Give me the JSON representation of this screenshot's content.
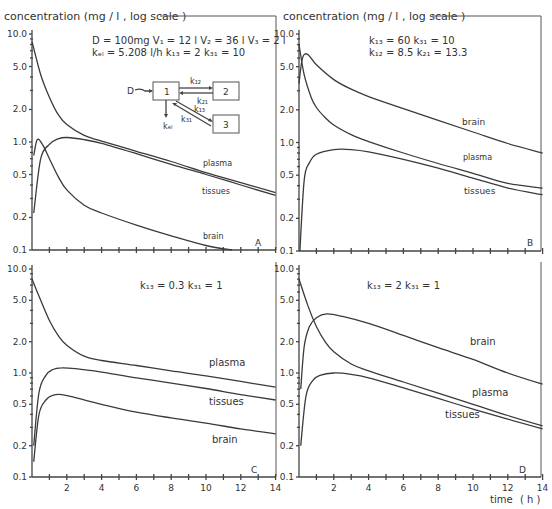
{
  "figure": {
    "ylabel_left": "concentration (mg / l , log scale )",
    "ylabel_right": "concentration (mg / l , log scale )",
    "xlabel": "time",
    "xunit": "( h )",
    "y_tick_labels": [
      "10.0",
      "5.0",
      "2.0",
      "1.0",
      "0.5",
      "0.2",
      "0.1"
    ],
    "x_tick_labels": [
      "2",
      "4",
      "6",
      "8",
      "10",
      "12",
      "14"
    ]
  },
  "panel_a": {
    "letter": "A",
    "params_line1": "D = 100mg  V₁ = 12 l  V₂ = 36 l  V₃ = 2 l",
    "params_line2": "kₑₗ = 5.208 l/h  k₁₃ = 2  k₃₁ = 10",
    "diagram": {
      "dose": "D",
      "box1": "1",
      "box2": "2",
      "box3": "3",
      "k12": "k₁₂",
      "k21": "k₂₁",
      "k13": "k₁₃",
      "k31": "k₃₁",
      "kel": "kₑₗ"
    },
    "labels": {
      "plasma": "plasma",
      "tissues": "tissues",
      "brain": "brain"
    }
  },
  "panel_b": {
    "letter": "B",
    "params_line1": "k₁₃ = 60  k₃₁ = 10",
    "params_line2": "k₁₂ = 8.5  k₂₁ = 13.3",
    "labels": {
      "plasma": "plasma",
      "tissues": "tissues",
      "brain": "brain"
    }
  },
  "panel_c": {
    "letter": "C",
    "params_line1": "k₁₃ = 0.3  k₃₁ = 1",
    "labels": {
      "plasma": "plasma",
      "tissues": "tissues",
      "brain": "brain"
    }
  },
  "panel_d": {
    "letter": "D",
    "params_line1": "k₁₃ = 2  k₃₁ = 1",
    "labels": {
      "plasma": "plasma",
      "tissues": "tissues",
      "brain": "brain"
    }
  },
  "chart_data": [
    {
      "type": "line",
      "title": "A",
      "xlabel": "time (h)",
      "ylabel": "concentration (mg/l, log scale)",
      "xlim": [
        0,
        14
      ],
      "ylim": [
        0.1,
        10
      ],
      "yscale": "log",
      "series": [
        {
          "name": "plasma",
          "x": [
            0,
            0.5,
            1,
            1.5,
            2,
            3,
            4,
            6,
            8,
            10,
            12,
            14
          ],
          "values": [
            8.5,
            4.2,
            2.6,
            1.8,
            1.45,
            1.15,
            1.02,
            0.82,
            0.66,
            0.52,
            0.42,
            0.34
          ]
        },
        {
          "name": "tissues",
          "x": [
            0.1,
            0.5,
            1,
            1.5,
            2,
            3,
            4,
            6,
            8,
            10,
            12,
            14
          ],
          "values": [
            0.22,
            0.7,
            0.95,
            1.07,
            1.1,
            1.05,
            0.97,
            0.78,
            0.62,
            0.5,
            0.4,
            0.32
          ]
        },
        {
          "name": "brain",
          "x": [
            0.1,
            0.3,
            0.6,
            1,
            1.5,
            2,
            3,
            4,
            6,
            8,
            10,
            11.5
          ],
          "values": [
            0.75,
            1.05,
            0.95,
            0.7,
            0.48,
            0.36,
            0.26,
            0.22,
            0.17,
            0.135,
            0.11,
            0.1
          ]
        }
      ]
    },
    {
      "type": "line",
      "title": "B",
      "xlabel": "time (h)",
      "ylabel": "concentration (mg/l, log scale)",
      "xlim": [
        0,
        14
      ],
      "ylim": [
        0.1,
        10
      ],
      "yscale": "log",
      "series": [
        {
          "name": "plasma",
          "x": [
            0,
            0.3,
            0.7,
            1,
            1.5,
            2,
            3,
            4,
            6,
            8,
            10,
            12,
            14
          ],
          "values": [
            8.0,
            4.2,
            2.6,
            2.1,
            1.7,
            1.45,
            1.18,
            1.02,
            0.8,
            0.64,
            0.52,
            0.42,
            0.38
          ]
        },
        {
          "name": "tissues",
          "x": [
            0.05,
            0.3,
            0.6,
            1,
            2,
            3,
            4,
            6,
            8,
            10,
            12,
            14
          ],
          "values": [
            0.1,
            0.45,
            0.65,
            0.78,
            0.86,
            0.86,
            0.82,
            0.7,
            0.58,
            0.47,
            0.38,
            0.33
          ]
        },
        {
          "name": "brain",
          "x": [
            0,
            0.2,
            0.5,
            1,
            2,
            3,
            4,
            6,
            8,
            10,
            12,
            14
          ],
          "values": [
            3.5,
            6.0,
            6.5,
            5.2,
            3.8,
            3.1,
            2.65,
            2.05,
            1.6,
            1.25,
            0.98,
            0.8
          ]
        }
      ]
    },
    {
      "type": "line",
      "title": "C",
      "xlabel": "time (h)",
      "ylabel": "concentration (mg/l, log scale)",
      "xlim": [
        0,
        14
      ],
      "ylim": [
        0.1,
        10
      ],
      "yscale": "log",
      "series": [
        {
          "name": "plasma",
          "x": [
            0,
            0.5,
            1,
            1.5,
            2,
            3,
            4,
            6,
            8,
            10,
            12,
            14
          ],
          "values": [
            8.0,
            5.0,
            3.2,
            2.3,
            1.85,
            1.45,
            1.32,
            1.18,
            1.05,
            0.94,
            0.83,
            0.73
          ]
        },
        {
          "name": "tissues",
          "x": [
            0.1,
            0.4,
            0.8,
            1.2,
            1.7,
            2.5,
            4,
            6,
            8,
            10,
            12,
            14
          ],
          "values": [
            0.2,
            0.65,
            0.95,
            1.08,
            1.12,
            1.1,
            1.02,
            0.9,
            0.8,
            0.71,
            0.62,
            0.55
          ]
        },
        {
          "name": "brain",
          "x": [
            0.1,
            0.4,
            0.8,
            1.2,
            1.7,
            2.5,
            4,
            6,
            8,
            10,
            12,
            14
          ],
          "values": [
            0.14,
            0.4,
            0.55,
            0.61,
            0.62,
            0.58,
            0.5,
            0.42,
            0.37,
            0.33,
            0.29,
            0.26
          ]
        }
      ]
    },
    {
      "type": "line",
      "title": "D",
      "xlabel": "time (h)",
      "ylabel": "concentration (mg/l, log scale)",
      "xlim": [
        0,
        14
      ],
      "ylim": [
        0.1,
        10
      ],
      "yscale": "log",
      "series": [
        {
          "name": "plasma",
          "x": [
            0,
            0.5,
            1,
            1.5,
            2,
            3,
            4,
            6,
            8,
            10,
            12,
            14
          ],
          "values": [
            8.0,
            4.5,
            2.8,
            2.0,
            1.6,
            1.22,
            1.05,
            0.82,
            0.64,
            0.5,
            0.39,
            0.31
          ]
        },
        {
          "name": "tissues",
          "x": [
            0.1,
            0.4,
            0.8,
            1.2,
            2,
            3,
            4,
            6,
            8,
            10,
            12,
            14
          ],
          "values": [
            0.2,
            0.6,
            0.85,
            0.95,
            1.0,
            0.97,
            0.9,
            0.72,
            0.57,
            0.45,
            0.36,
            0.29
          ]
        },
        {
          "name": "brain",
          "x": [
            0.1,
            0.3,
            0.6,
            1,
            1.6,
            2.5,
            4,
            6,
            8,
            10,
            12,
            14
          ],
          "values": [
            0.7,
            1.8,
            2.8,
            3.4,
            3.7,
            3.5,
            3.0,
            2.3,
            1.75,
            1.35,
            1.0,
            0.78
          ]
        }
      ]
    }
  ]
}
